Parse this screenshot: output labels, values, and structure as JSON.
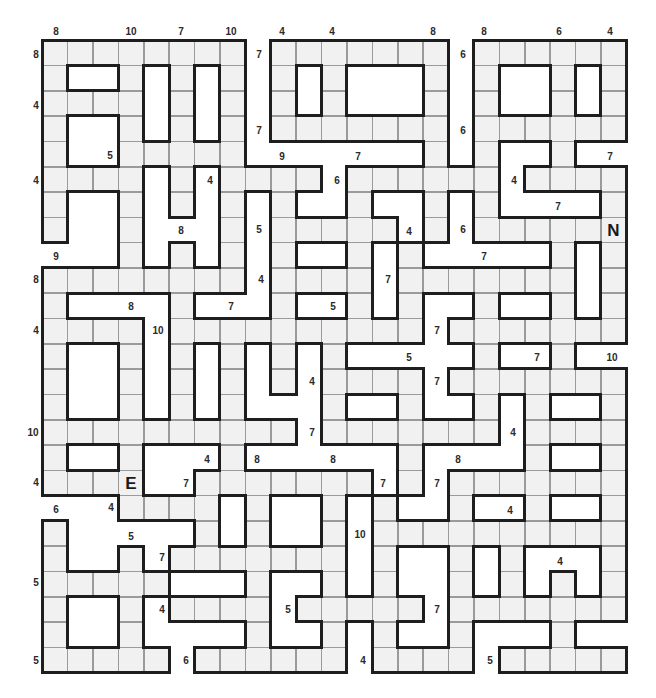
{
  "puzzle": {
    "type": "number skeleton / fill-in grid",
    "grid_origin": [
      42,
      40
    ],
    "cell_size": [
      25.4,
      25.3
    ],
    "cols": 23,
    "rows": 25,
    "colors": {
      "cell": "#f1f1f1",
      "grid_line": "#9a9a9a",
      "border": "#1e1e1e",
      "background": "#ffffff"
    },
    "grid": [
      "########.#######.######",
      "#..#.#.#.#.#...#.#..#.#",
      "####.#.#.#.#...#.#..#.#",
      "#..#.#.#.#######.######",
      "#..#####.......#.#..#..",
      "####.#.####.######.####",
      "#..#.#.#.#..#..#.#....#",
      "#..#...#.#####.#.######",
      "...#.#.#.#..#.#.....#.#",
      "########.####.#######.#",
      "#....#...#..#.#..#..#.#",
      "####.##########.#######",
      "#..#.#.#.#.#.....#..#..",
      "#..#.#.#.#.####.#######",
      "#..#.#.#...#..#..#.#..#",
      "##########.#######.####",
      "#..#...#......#....#..#",
      "####..#######.#.#######",
      "...####.#..#.#..#..#..#",
      "#.....#.#..#.##########",
      "#..#.#######.#..#.#...#",
      "#####...#..#.#..#.#.#.#",
      "#..#.####.#####.#######",
      "#..#....#..#.#..#...#..",
      "#####.######.####.#####"
    ],
    "letters": [
      {
        "char": "E",
        "row": 17,
        "col": 3
      },
      {
        "char": "N",
        "row": 7,
        "col": 22
      }
    ],
    "clues": [
      {
        "text": "8",
        "x": 56,
        "y": 32
      },
      {
        "text": "10",
        "x": 131,
        "y": 32
      },
      {
        "text": "7",
        "x": 181,
        "y": 32
      },
      {
        "text": "10",
        "x": 231,
        "y": 32
      },
      {
        "text": "4",
        "x": 282,
        "y": 32
      },
      {
        "text": "4",
        "x": 332,
        "y": 32
      },
      {
        "text": "8",
        "x": 433,
        "y": 32
      },
      {
        "text": "8",
        "x": 484,
        "y": 32
      },
      {
        "text": "6",
        "x": 559,
        "y": 32
      },
      {
        "text": "4",
        "x": 610,
        "y": 32
      },
      {
        "text": "8",
        "x": 36,
        "y": 55
      },
      {
        "text": "4",
        "x": 36,
        "y": 106
      },
      {
        "text": "4",
        "x": 36,
        "y": 181
      },
      {
        "text": "9",
        "x": 56,
        "y": 257
      },
      {
        "text": "8",
        "x": 36,
        "y": 280
      },
      {
        "text": "4",
        "x": 36,
        "y": 331
      },
      {
        "text": "10",
        "x": 33,
        "y": 433
      },
      {
        "text": "4",
        "x": 36,
        "y": 483
      },
      {
        "text": "6",
        "x": 56,
        "y": 510
      },
      {
        "text": "5",
        "x": 36,
        "y": 583
      },
      {
        "text": "5",
        "x": 36,
        "y": 661
      },
      {
        "text": "7",
        "x": 259,
        "y": 55
      },
      {
        "text": "6",
        "x": 463,
        "y": 55
      },
      {
        "text": "7",
        "x": 259,
        "y": 131
      },
      {
        "text": "6",
        "x": 463,
        "y": 131
      },
      {
        "text": "5",
        "x": 110,
        "y": 156
      },
      {
        "text": "9",
        "x": 282,
        "y": 157
      },
      {
        "text": "7",
        "x": 358,
        "y": 157
      },
      {
        "text": "7",
        "x": 610,
        "y": 157
      },
      {
        "text": "4",
        "x": 210,
        "y": 181
      },
      {
        "text": "6",
        "x": 337,
        "y": 181
      },
      {
        "text": "4",
        "x": 514,
        "y": 181
      },
      {
        "text": "8",
        "x": 181,
        "y": 231
      },
      {
        "text": "5",
        "x": 259,
        "y": 230
      },
      {
        "text": "4",
        "x": 409,
        "y": 232
      },
      {
        "text": "6",
        "x": 463,
        "y": 230
      },
      {
        "text": "7",
        "x": 558,
        "y": 207
      },
      {
        "text": "4",
        "x": 261,
        "y": 280
      },
      {
        "text": "7",
        "x": 388,
        "y": 280
      },
      {
        "text": "7",
        "x": 484,
        "y": 257
      },
      {
        "text": "8",
        "x": 131,
        "y": 307
      },
      {
        "text": "7",
        "x": 231,
        "y": 307
      },
      {
        "text": "5",
        "x": 333,
        "y": 307
      },
      {
        "text": "10",
        "x": 158,
        "y": 331
      },
      {
        "text": "7",
        "x": 437,
        "y": 331
      },
      {
        "text": "5",
        "x": 409,
        "y": 358
      },
      {
        "text": "7",
        "x": 537,
        "y": 358
      },
      {
        "text": "10",
        "x": 612,
        "y": 358
      },
      {
        "text": "4",
        "x": 312,
        "y": 382
      },
      {
        "text": "7",
        "x": 437,
        "y": 382
      },
      {
        "text": "7",
        "x": 312,
        "y": 433
      },
      {
        "text": "4",
        "x": 513,
        "y": 433
      },
      {
        "text": "4",
        "x": 207,
        "y": 460
      },
      {
        "text": "8",
        "x": 257,
        "y": 460
      },
      {
        "text": "8",
        "x": 333,
        "y": 460
      },
      {
        "text": "8",
        "x": 458,
        "y": 460
      },
      {
        "text": "7",
        "x": 186,
        "y": 484
      },
      {
        "text": "7",
        "x": 383,
        "y": 484
      },
      {
        "text": "7",
        "x": 437,
        "y": 484
      },
      {
        "text": "4",
        "x": 111,
        "y": 508
      },
      {
        "text": "4",
        "x": 510,
        "y": 511
      },
      {
        "text": "5",
        "x": 131,
        "y": 537
      },
      {
        "text": "10",
        "x": 360,
        "y": 535
      },
      {
        "text": "7",
        "x": 162,
        "y": 558
      },
      {
        "text": "4",
        "x": 560,
        "y": 562
      },
      {
        "text": "4",
        "x": 162,
        "y": 610
      },
      {
        "text": "5",
        "x": 288,
        "y": 610
      },
      {
        "text": "7",
        "x": 437,
        "y": 610
      },
      {
        "text": "6",
        "x": 186,
        "y": 661
      },
      {
        "text": "4",
        "x": 363,
        "y": 661
      },
      {
        "text": "5",
        "x": 490,
        "y": 661
      }
    ]
  }
}
